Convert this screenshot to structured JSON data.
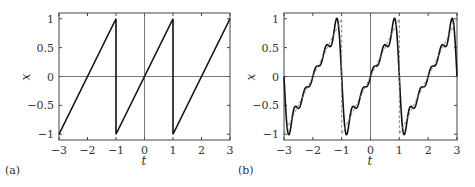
{
  "chart_data": [
    {
      "type": "line",
      "panel_label": "(a)",
      "title": "",
      "xlabel": "t",
      "ylabel": "x",
      "xlim": [
        -3,
        3
      ],
      "ylim": [
        -1.1,
        1.1
      ],
      "xticks": [
        -3,
        -2,
        -1,
        0,
        1,
        2,
        3
      ],
      "xtick_labels": [
        "−3",
        "−2",
        "−1",
        "0",
        "1",
        "2",
        "3"
      ],
      "yticks": [
        1,
        0.5,
        0,
        -0.5,
        -1
      ],
      "ytick_labels": [
        "1",
        "0.5",
        "0",
        "−0.5",
        "−1"
      ],
      "grid": false,
      "zero_lines": true,
      "series": [
        {
          "name": "sawtooth",
          "style": "solid",
          "description": "x(t) = t - 2k, period 2, jumps at t = -1 and t = 1",
          "x": [
            -3,
            -1,
            -1,
            1,
            1,
            3
          ],
          "y": [
            -1,
            1,
            -1,
            1,
            -1,
            1
          ]
        }
      ]
    },
    {
      "type": "line",
      "panel_label": "(b)",
      "title": "",
      "xlabel": "t",
      "ylabel": "x",
      "xlim": [
        -3,
        3
      ],
      "ylim": [
        -1.1,
        1.1
      ],
      "xticks": [
        -3,
        -2,
        -1,
        0,
        1,
        2,
        3
      ],
      "xtick_labels": [
        "−3",
        "−2",
        "−1",
        "0",
        "1",
        "2",
        "3"
      ],
      "yticks": [
        1,
        0.5,
        0,
        -0.5,
        -1
      ],
      "ytick_labels": [
        "1",
        "0.5",
        "0",
        "−0.5",
        "−1"
      ],
      "grid": false,
      "zero_lines": true,
      "series": [
        {
          "name": "fourier-approximation",
          "style": "solid",
          "description": "Truncated Fourier series of sawtooth: sum_{n=1}^{N} (2/(n*pi)) (-1)^(n+1) sin(n*pi*t), showing Gibbs overshoot ~1.05",
          "harmonics": 5
        },
        {
          "name": "sawtooth",
          "style": "dashed",
          "x": [
            -3,
            -1,
            -1,
            1,
            1,
            3
          ],
          "y": [
            -1,
            1,
            -1,
            1,
            -1,
            1
          ]
        }
      ]
    }
  ],
  "panels": {
    "a": {
      "label": "(a)",
      "xlabel": "t",
      "ylabel": "x"
    },
    "b": {
      "label": "(b)",
      "xlabel": "t",
      "ylabel": "x"
    }
  }
}
